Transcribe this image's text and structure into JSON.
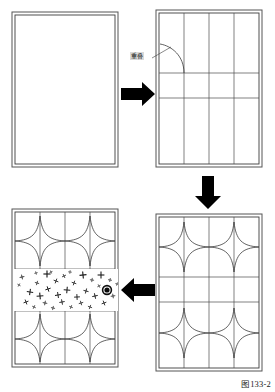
{
  "figure": {
    "caption": "图133-2",
    "background_color": "#ffffff",
    "ink_color": "#1a1a1a",
    "grid_color": "#4a4a4a",
    "arrow_color": "#000000",
    "panel_fill": "#ffffff",
    "panel_border_color": "#555555"
  },
  "annotations": {
    "overlap_label": "重叠"
  },
  "panels": [
    {
      "id": "panel-blank",
      "name": "blank-rectangle-panel",
      "step": 1,
      "position": "top-left",
      "x": 12,
      "y": 12,
      "width": 106,
      "height": 155,
      "description": "empty double-bordered rectangle",
      "columns": 0,
      "rows": 0,
      "has_stars": false,
      "has_speckles": false
    },
    {
      "id": "panel-grid",
      "name": "grid-divided-panel",
      "step": 2,
      "position": "top-right",
      "x": 156,
      "y": 10,
      "width": 106,
      "height": 157,
      "description": "rectangle divided into 4 columns and 3 rows with an overlap arc",
      "columns": 4,
      "rows": 3,
      "has_stars": false,
      "has_speckles": false,
      "has_overlap_arc": true
    },
    {
      "id": "panel-stars",
      "name": "star-pattern-panel",
      "step": 3,
      "position": "bottom-right",
      "x": 156,
      "y": 214,
      "width": 106,
      "height": 157,
      "description": "grid with concave four-point star motifs in the top and bottom bands",
      "columns": 4,
      "rows": 3,
      "has_stars": true,
      "has_speckles": false
    },
    {
      "id": "panel-finished",
      "name": "finished-pattern-panel",
      "step": 4,
      "position": "bottom-left",
      "x": 12,
      "y": 209,
      "width": 106,
      "height": 158,
      "description": "star pattern with the middle band filled with scattered cross marks and a dark knot dot",
      "columns": 4,
      "rows": 3,
      "has_stars": true,
      "has_speckles": true,
      "speckle_count": 34,
      "knot_dot": {
        "x": 107,
        "y": 290,
        "radius": 4.2
      }
    }
  ],
  "arrows": [
    {
      "id": "arrow-1",
      "name": "arrow-right-step1-to-step2",
      "direction": "right",
      "from": "panel-blank",
      "to": "panel-grid",
      "x": 121,
      "y": 94
    },
    {
      "id": "arrow-2",
      "name": "arrow-down-step2-to-step3",
      "direction": "down",
      "from": "panel-grid",
      "to": "panel-stars",
      "x": 208,
      "y": 176
    },
    {
      "id": "arrow-3",
      "name": "arrow-left-step3-to-step4",
      "direction": "left",
      "from": "panel-stars",
      "to": "panel-finished",
      "x": 128,
      "y": 290
    }
  ],
  "speckles": [
    {
      "x": 22,
      "y": 277,
      "s": 2.4,
      "r": -12
    },
    {
      "x": 30,
      "y": 292,
      "s": 3.2,
      "r": 8
    },
    {
      "x": 26,
      "y": 302,
      "s": 2.6,
      "r": -20
    },
    {
      "x": 37,
      "y": 283,
      "s": 2.2,
      "r": 15
    },
    {
      "x": 40,
      "y": 296,
      "s": 3.4,
      "r": -5
    },
    {
      "x": 34,
      "y": 307,
      "s": 2.0,
      "r": 25
    },
    {
      "x": 47,
      "y": 274,
      "s": 3.6,
      "r": 0
    },
    {
      "x": 48,
      "y": 289,
      "s": 2.8,
      "r": -18
    },
    {
      "x": 45,
      "y": 303,
      "s": 2.3,
      "r": 10
    },
    {
      "x": 56,
      "y": 281,
      "s": 2.5,
      "r": 20
    },
    {
      "x": 58,
      "y": 295,
      "s": 3.0,
      "r": -8
    },
    {
      "x": 53,
      "y": 308,
      "s": 2.1,
      "r": 12
    },
    {
      "x": 64,
      "y": 276,
      "s": 2.2,
      "r": -25
    },
    {
      "x": 67,
      "y": 290,
      "s": 3.3,
      "r": 5
    },
    {
      "x": 62,
      "y": 302,
      "s": 2.7,
      "r": -10
    },
    {
      "x": 74,
      "y": 283,
      "s": 2.4,
      "r": 18
    },
    {
      "x": 77,
      "y": 297,
      "s": 2.9,
      "r": -3
    },
    {
      "x": 71,
      "y": 307,
      "s": 2.0,
      "r": 22
    },
    {
      "x": 83,
      "y": 275,
      "s": 3.5,
      "r": -6
    },
    {
      "x": 86,
      "y": 291,
      "s": 2.6,
      "r": 14
    },
    {
      "x": 81,
      "y": 303,
      "s": 2.3,
      "r": -16
    },
    {
      "x": 92,
      "y": 280,
      "s": 2.1,
      "r": 8
    },
    {
      "x": 95,
      "y": 296,
      "s": 2.8,
      "r": -12
    },
    {
      "x": 90,
      "y": 307,
      "s": 2.2,
      "r": 20
    },
    {
      "x": 101,
      "y": 275,
      "s": 3.4,
      "r": 0
    },
    {
      "x": 104,
      "y": 303,
      "s": 2.5,
      "r": -20
    },
    {
      "x": 110,
      "y": 280,
      "s": 2.0,
      "r": 10
    },
    {
      "x": 113,
      "y": 296,
      "s": 2.3,
      "r": -8
    },
    {
      "x": 19,
      "y": 285,
      "s": 1.8,
      "r": 30
    },
    {
      "x": 99,
      "y": 286,
      "s": 1.9,
      "r": -28
    },
    {
      "x": 70,
      "y": 272,
      "s": 1.8,
      "r": 6
    },
    {
      "x": 36,
      "y": 273,
      "s": 1.7,
      "r": -14
    },
    {
      "x": 117,
      "y": 284,
      "s": 1.7,
      "r": 16
    },
    {
      "x": 51,
      "y": 272,
      "s": 1.6,
      "r": -22
    }
  ]
}
